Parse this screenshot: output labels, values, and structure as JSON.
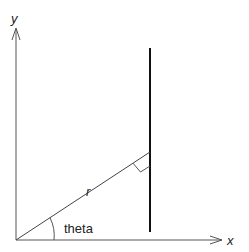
{
  "diagram": {
    "axes": {
      "x_label": "x",
      "y_label": "y"
    },
    "labels": {
      "radius": "r",
      "angle": "theta"
    },
    "colors": {
      "axis": "#555555",
      "line": "#111111",
      "text": "#222222"
    }
  }
}
